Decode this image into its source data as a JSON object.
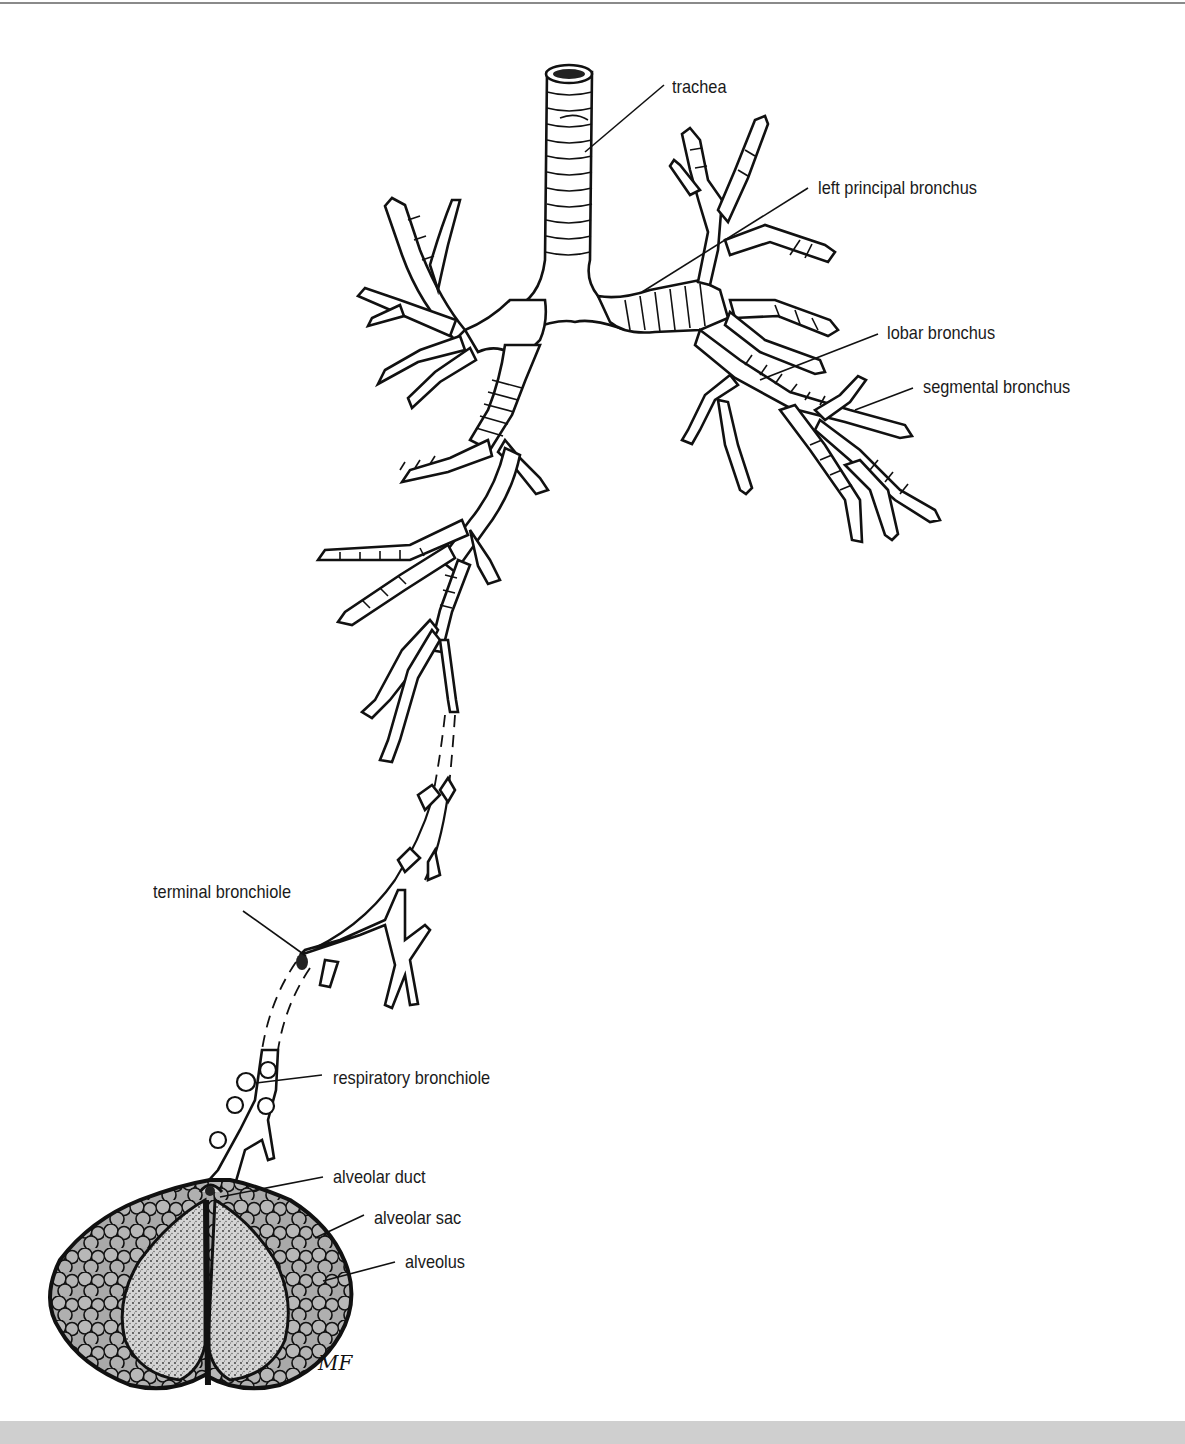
{
  "figure": {
    "artist_initials": "MF",
    "colors": {
      "background": "#ffffff",
      "ink": "#111111",
      "label_text": "#1a1a1a",
      "alveolus_fill": "#a9a9a9",
      "sac_interior": "#d0d0d0",
      "top_rule": "#8a8a8a",
      "bottom_band": "#cfcfcf"
    }
  },
  "labels": [
    {
      "id": "trachea",
      "text": "trachea",
      "x": 672,
      "y": 77
    },
    {
      "id": "left-principal-bronchus",
      "text": "left principal bronchus",
      "x": 818,
      "y": 178
    },
    {
      "id": "lobar-bronchus",
      "text": "lobar bronchus",
      "x": 887,
      "y": 323
    },
    {
      "id": "segmental-bronchus",
      "text": "segmental bronchus",
      "x": 923,
      "y": 377
    },
    {
      "id": "terminal-bronchiole",
      "text": "terminal bronchiole",
      "x": 153,
      "y": 882
    },
    {
      "id": "respiratory-bronchiole",
      "text": "respiratory bronchiole",
      "x": 333,
      "y": 1068
    },
    {
      "id": "alveolar-duct",
      "text": "alveolar duct",
      "x": 333,
      "y": 1167
    },
    {
      "id": "alveolar-sac",
      "text": "alveolar sac",
      "x": 374,
      "y": 1208
    },
    {
      "id": "alveolus",
      "text": "alveolus",
      "x": 405,
      "y": 1252
    }
  ],
  "leaders": [
    {
      "id": "trachea",
      "x1": 664,
      "y1": 85,
      "x2": 585,
      "y2": 152
    },
    {
      "id": "left-principal-bronchus",
      "x1": 808,
      "y1": 188,
      "x2": 642,
      "y2": 292
    },
    {
      "id": "lobar-bronchus",
      "x1": 878,
      "y1": 334,
      "x2": 760,
      "y2": 380
    },
    {
      "id": "segmental-bronchus",
      "x1": 913,
      "y1": 388,
      "x2": 855,
      "y2": 410
    },
    {
      "id": "terminal-bronchiole",
      "x1": 243,
      "y1": 911,
      "x2": 306,
      "y2": 956
    },
    {
      "id": "respiratory-bronchiole",
      "x1": 322,
      "y1": 1075,
      "x2": 256,
      "y2": 1083
    },
    {
      "id": "alveolar-duct",
      "x1": 323,
      "y1": 1177,
      "x2": 220,
      "y2": 1197
    },
    {
      "id": "alveolar-sac",
      "x1": 364,
      "y1": 1215,
      "x2": 315,
      "y2": 1238
    },
    {
      "id": "alveolus",
      "x1": 395,
      "y1": 1262,
      "x2": 323,
      "y2": 1281
    }
  ]
}
